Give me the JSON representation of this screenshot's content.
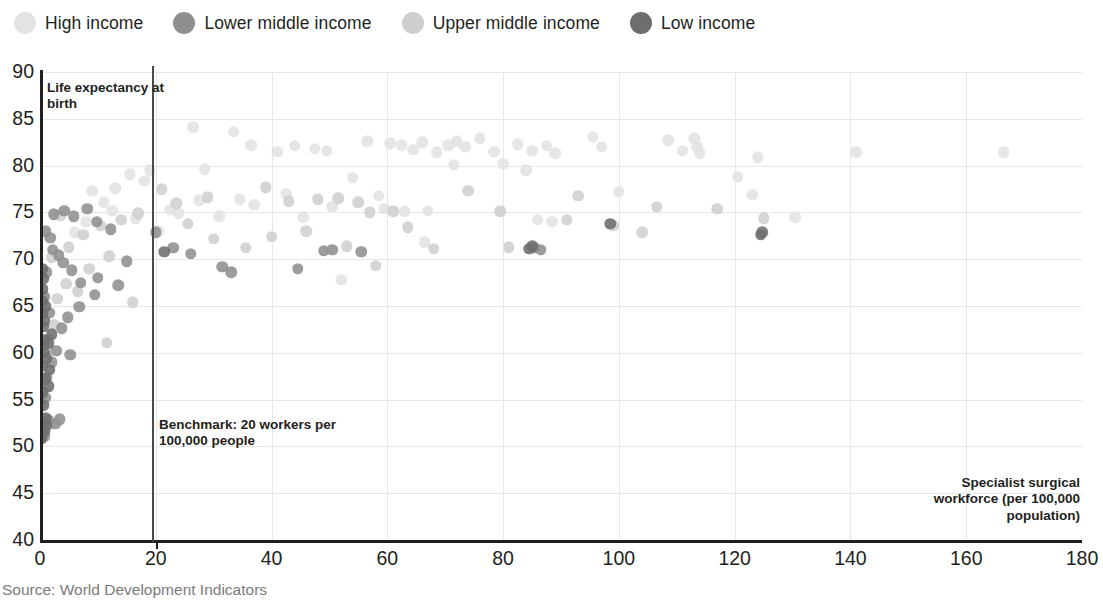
{
  "legend": {
    "items": [
      {
        "label": "High income",
        "key": "high",
        "color": "#e3e3e3"
      },
      {
        "label": "Lower middle income",
        "key": "lower_middle",
        "color": "#8f8f8f"
      },
      {
        "label": "Upper middle income",
        "key": "upper_middle",
        "color": "#cfcfcf"
      },
      {
        "label": "Low income",
        "key": "low",
        "color": "#6e6e6e"
      }
    ]
  },
  "annotations": {
    "y_axis_title": "Life expectancy at birth",
    "benchmark": "Benchmark: 20 workers per 100,000 people",
    "x_axis_title": "Specialist surgical workforce (per 100,000 population)"
  },
  "source": "Source: World Development Indicators",
  "chart_data": {
    "type": "scatter",
    "title": "",
    "xlabel": "Specialist surgical workforce (per 100,000 population)",
    "ylabel": "Life expectancy at birth",
    "xlim": [
      0,
      180
    ],
    "ylim": [
      40,
      90
    ],
    "xticks": [
      0,
      20,
      40,
      60,
      80,
      100,
      120,
      140,
      160,
      180
    ],
    "yticks": [
      40,
      45,
      50,
      55,
      60,
      65,
      70,
      75,
      80,
      85,
      90
    ],
    "grid": true,
    "legend_position": "top-left",
    "reference_lines": [
      {
        "axis": "x",
        "value": 20,
        "label": "Benchmark: 20 workers per 100,000 people",
        "color": "#4a4a4a"
      }
    ],
    "series": [
      {
        "name": "High income",
        "color": "#e3e3e3",
        "points": [
          [
            26.5,
            84.1
          ],
          [
            33.5,
            83.6
          ],
          [
            36.5,
            82.2
          ],
          [
            41.0,
            81.5
          ],
          [
            44.0,
            82.1
          ],
          [
            47.5,
            81.8
          ],
          [
            49.5,
            81.6
          ],
          [
            56.5,
            82.6
          ],
          [
            60.5,
            82.4
          ],
          [
            62.5,
            82.2
          ],
          [
            64.5,
            81.7
          ],
          [
            66.0,
            82.5
          ],
          [
            68.5,
            81.4
          ],
          [
            70.5,
            82.2
          ],
          [
            72.0,
            82.6
          ],
          [
            73.5,
            82.0
          ],
          [
            76.0,
            82.9
          ],
          [
            78.5,
            81.5
          ],
          [
            80.0,
            80.2
          ],
          [
            82.5,
            82.3
          ],
          [
            85.0,
            81.6
          ],
          [
            87.5,
            82.1
          ],
          [
            89.0,
            81.3
          ],
          [
            95.5,
            83.1
          ],
          [
            97.0,
            82.0
          ],
          [
            108.5,
            82.7
          ],
          [
            111.0,
            81.6
          ],
          [
            113.0,
            82.9
          ],
          [
            113.5,
            82.0
          ],
          [
            114.0,
            81.3
          ],
          [
            124.0,
            80.9
          ],
          [
            141.0,
            81.4
          ],
          [
            166.5,
            81.4
          ],
          [
            28.5,
            79.6
          ],
          [
            54.0,
            78.7
          ],
          [
            71.5,
            80.1
          ],
          [
            84.0,
            79.5
          ],
          [
            100.0,
            77.2
          ],
          [
            120.5,
            78.8
          ],
          [
            123.0,
            76.9
          ],
          [
            58.5,
            76.8
          ],
          [
            59.5,
            75.4
          ],
          [
            63.0,
            75.1
          ],
          [
            42.5,
            77.0
          ],
          [
            45.5,
            74.5
          ],
          [
            50.5,
            75.6
          ],
          [
            67.0,
            75.2
          ],
          [
            86.0,
            74.2
          ],
          [
            88.5,
            74.0
          ],
          [
            130.5,
            74.5
          ],
          [
            34.5,
            76.4
          ],
          [
            37.0,
            75.8
          ],
          [
            31.0,
            74.6
          ],
          [
            22.5,
            75.3
          ],
          [
            24.0,
            74.9
          ],
          [
            27.5,
            76.3
          ],
          [
            18.0,
            78.4
          ],
          [
            15.5,
            79.1
          ],
          [
            13.0,
            77.6
          ],
          [
            11.0,
            76.1
          ],
          [
            9.0,
            77.3
          ],
          [
            16.5,
            74.4
          ],
          [
            12.5,
            75.2
          ],
          [
            8.0,
            74.0
          ],
          [
            6.0,
            72.9
          ],
          [
            20.5,
            73.0
          ],
          [
            19.0,
            79.5
          ],
          [
            52.0,
            67.8
          ],
          [
            66.5,
            71.8
          ]
        ]
      },
      {
        "name": "Upper middle income",
        "color": "#cfcfcf",
        "points": [
          [
            21.0,
            77.5
          ],
          [
            23.5,
            76.0
          ],
          [
            29.0,
            76.6
          ],
          [
            39.0,
            77.7
          ],
          [
            43.0,
            76.2
          ],
          [
            48.0,
            76.4
          ],
          [
            51.5,
            76.5
          ],
          [
            55.0,
            76.1
          ],
          [
            57.0,
            75.0
          ],
          [
            61.0,
            75.1
          ],
          [
            74.0,
            77.3
          ],
          [
            79.5,
            75.1
          ],
          [
            91.0,
            74.2
          ],
          [
            93.0,
            76.8
          ],
          [
            104.0,
            72.9
          ],
          [
            106.5,
            75.6
          ],
          [
            117.0,
            75.4
          ],
          [
            125.0,
            74.4
          ],
          [
            17.0,
            74.9
          ],
          [
            14.0,
            74.2
          ],
          [
            10.5,
            73.6
          ],
          [
            7.5,
            72.6
          ],
          [
            5.0,
            71.3
          ],
          [
            46.0,
            73.0
          ],
          [
            53.0,
            71.4
          ],
          [
            68.0,
            71.1
          ],
          [
            30.0,
            72.2
          ],
          [
            25.5,
            73.8
          ],
          [
            35.5,
            71.2
          ],
          [
            12.0,
            70.3
          ],
          [
            8.5,
            69.0
          ],
          [
            4.5,
            67.4
          ],
          [
            3.0,
            65.8
          ],
          [
            16.0,
            65.4
          ],
          [
            11.5,
            61.1
          ],
          [
            6.5,
            66.6
          ],
          [
            2.5,
            63.0
          ],
          [
            1.5,
            61.5
          ],
          [
            58.0,
            69.3
          ],
          [
            81.0,
            71.3
          ],
          [
            40.0,
            72.4
          ],
          [
            63.5,
            73.4
          ],
          [
            99.0,
            73.6
          ],
          [
            2.0,
            70.2
          ],
          [
            3.5,
            74.7
          ]
        ]
      },
      {
        "name": "Lower middle income",
        "color": "#8f8f8f",
        "points": [
          [
            20.0,
            72.9
          ],
          [
            23.0,
            71.2
          ],
          [
            26.0,
            70.6
          ],
          [
            31.5,
            69.2
          ],
          [
            33.0,
            68.6
          ],
          [
            44.5,
            69.0
          ],
          [
            49.0,
            70.9
          ],
          [
            50.5,
            71.0
          ],
          [
            55.5,
            70.8
          ],
          [
            85.5,
            71.2
          ],
          [
            86.5,
            71.0
          ],
          [
            1.0,
            73.0
          ],
          [
            1.8,
            72.3
          ],
          [
            2.2,
            71.0
          ],
          [
            3.2,
            70.4
          ],
          [
            4.0,
            69.6
          ],
          [
            5.5,
            68.8
          ],
          [
            7.0,
            67.5
          ],
          [
            9.5,
            66.2
          ],
          [
            10.0,
            68.0
          ],
          [
            13.5,
            67.2
          ],
          [
            15.0,
            69.8
          ],
          [
            6.8,
            64.9
          ],
          [
            4.8,
            63.8
          ],
          [
            3.8,
            62.6
          ],
          [
            2.8,
            60.2
          ],
          [
            2.0,
            59.0
          ],
          [
            1.2,
            57.4
          ],
          [
            0.9,
            55.2
          ],
          [
            1.4,
            52.8
          ],
          [
            2.6,
            52.4
          ],
          [
            3.4,
            52.9
          ],
          [
            0.7,
            51.1
          ],
          [
            0.6,
            60.8
          ],
          [
            0.8,
            66.0
          ],
          [
            1.6,
            64.3
          ],
          [
            5.2,
            59.8
          ],
          [
            1.1,
            68.6
          ],
          [
            2.4,
            74.8
          ],
          [
            4.2,
            75.2
          ],
          [
            5.8,
            74.6
          ],
          [
            8.2,
            75.4
          ],
          [
            9.8,
            74.0
          ],
          [
            12.2,
            73.2
          ]
        ]
      },
      {
        "name": "Low income",
        "color": "#6e6e6e",
        "points": [
          [
            0.5,
            64.2
          ],
          [
            0.6,
            62.8
          ],
          [
            0.7,
            61.4
          ],
          [
            0.8,
            60.0
          ],
          [
            0.4,
            58.6
          ],
          [
            0.9,
            57.2
          ],
          [
            0.5,
            55.8
          ],
          [
            0.6,
            54.4
          ],
          [
            1.0,
            53.0
          ],
          [
            0.7,
            51.6
          ],
          [
            1.2,
            52.2
          ],
          [
            0.4,
            65.5
          ],
          [
            0.8,
            63.4
          ],
          [
            1.1,
            59.4
          ],
          [
            0.5,
            66.8
          ],
          [
            1.4,
            61.0
          ],
          [
            0.6,
            67.9
          ],
          [
            0.9,
            65.0
          ],
          [
            1.5,
            56.4
          ],
          [
            0.3,
            50.8
          ],
          [
            2.0,
            62.0
          ],
          [
            1.7,
            58.2
          ],
          [
            0.35,
            69.0
          ],
          [
            21.5,
            70.8
          ],
          [
            98.5,
            73.8
          ],
          [
            124.5,
            72.6
          ],
          [
            124.8,
            72.9
          ],
          [
            84.5,
            71.1
          ],
          [
            85.0,
            71.4
          ]
        ]
      }
    ]
  }
}
